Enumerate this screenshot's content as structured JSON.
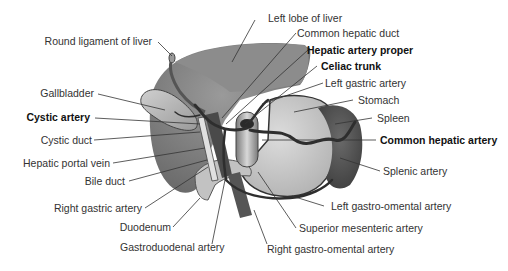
{
  "figure": {
    "colors": {
      "liver": "#8a8a8a",
      "liver_dark": "#6e6e6e",
      "gallbladder": "#b8b8b8",
      "stomach": "#c8c8c8",
      "spleen": "#555555",
      "duodenum": "#bdbdbd",
      "vessel": "#3a3a3a",
      "leader_line": "#333333",
      "background": "#ffffff"
    },
    "labels": {
      "round_ligament": "Round ligament of liver",
      "left_lobe": "Left lobe of liver",
      "common_hepatic_duct": "Common hepatic duct",
      "hepatic_artery_proper": "Hepatic artery proper",
      "celiac_trunk": "Celiac trunk",
      "left_gastric_artery": "Left gastric artery",
      "gallbladder": "Gallbladder",
      "stomach": "Stomach",
      "cystic_artery": "Cystic artery",
      "spleen": "Spleen",
      "cystic_duct": "Cystic duct",
      "common_hepatic_artery": "Common hepatic artery",
      "hepatic_portal_vein": "Hepatic portal vein",
      "splenic_artery": "Splenic artery",
      "bile_duct": "Bile duct",
      "left_gastro_omental_artery": "Left gastro-omental artery",
      "right_gastric_artery": "Right gastric artery",
      "superior_mesenteric_artery": "Superior mesenteric artery",
      "duodenum": "Duodenum",
      "gastroduodenal_artery": "Gastroduodenal artery",
      "right_gastro_omental_artery": "Right gastro-omental artery"
    },
    "bold_labels": [
      "Hepatic artery proper",
      "Celiac trunk",
      "Cystic artery",
      "Common hepatic artery"
    ]
  }
}
